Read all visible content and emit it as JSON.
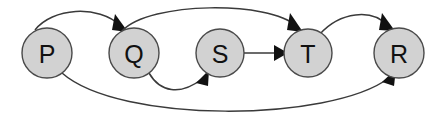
{
  "diagram": {
    "type": "directed-graph",
    "title": "",
    "background_color": "#ffffff",
    "node_fill_color": "#d2d2d2",
    "node_stroke_color": "#4a4a4a",
    "edge_color": "#3a3a3a",
    "label_color": "#111111",
    "nodes": [
      {
        "id": "P",
        "label": "P",
        "cx": 47,
        "cy": 53,
        "r": 25
      },
      {
        "id": "Q",
        "label": "Q",
        "cx": 134,
        "cy": 53,
        "r": 25
      },
      {
        "id": "S",
        "label": "S",
        "cx": 220,
        "cy": 53,
        "r": 24
      },
      {
        "id": "T",
        "label": "T",
        "cx": 308,
        "cy": 53,
        "r": 24
      },
      {
        "id": "R",
        "label": "R",
        "cx": 399,
        "cy": 53,
        "r": 25
      }
    ],
    "edges": [
      {
        "id": "edge-p-q",
        "from": "P",
        "to": "Q",
        "style": "arc-above",
        "label": ""
      },
      {
        "id": "edge-q-t",
        "from": "Q",
        "to": "T",
        "style": "arc-above",
        "label": ""
      },
      {
        "id": "edge-t-r",
        "from": "T",
        "to": "R",
        "style": "arc-above",
        "label": ""
      },
      {
        "id": "edge-s-t",
        "from": "S",
        "to": "T",
        "style": "straight",
        "label": ""
      },
      {
        "id": "edge-q-s",
        "from": "Q",
        "to": "S",
        "style": "arc-below",
        "label": ""
      },
      {
        "id": "edge-p-r",
        "from": "P",
        "to": "R",
        "style": "arc-below",
        "label": ""
      }
    ]
  }
}
